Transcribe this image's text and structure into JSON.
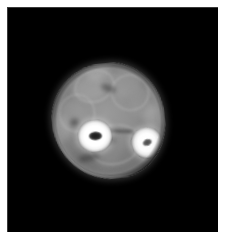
{
  "page": {
    "background_color": "#ffffff",
    "width": 225,
    "height": 239
  },
  "scan": {
    "name": "axial-limb-cross-section",
    "modality": "grayscale-tomographic-slice",
    "background_color": "#000000",
    "canvas": {
      "x": 7,
      "y": 7,
      "width": 211,
      "height": 225
    },
    "visible_text": "",
    "annotations": [],
    "colors": {
      "background": "#000000",
      "soft_tissue_mid": "#8e8e8e",
      "soft_tissue_bright": "#b0b0b0",
      "soft_tissue_dark": "#5a5a5a",
      "cortical_bone": "#ffffff",
      "marrow_dark": "#1a1a1a",
      "marrow_mid": "#5c5c5c",
      "page_margin": "#ffffff"
    },
    "structures": {
      "limb_outline": {
        "label": "limb-cross-section",
        "center_x": 108,
        "center_y": 121,
        "width": 113,
        "height": 116,
        "rotation_deg": -6
      },
      "bone_large": {
        "label": "bone-tibia",
        "center_x": 83,
        "center_y": 127,
        "width": 35,
        "height": 33,
        "marrow_center_x": 84,
        "marrow_center_y": 128,
        "marrow_width": 14,
        "marrow_height": 9,
        "intensity": "hyperintense-cortex-hypointense-marrow"
      },
      "bone_small": {
        "label": "bone-fibula",
        "center_x": 135,
        "center_y": 140,
        "width": 31,
        "height": 32,
        "marrow_center_x": 136,
        "marrow_center_y": 141,
        "marrow_width": 10,
        "marrow_height": 7,
        "intensity": "hyperintense-cortex-isointense-marrow"
      },
      "interosseous_membrane": {
        "label": "interosseous-membrane",
        "start_x": 100,
        "start_y": 131,
        "end_x": 126,
        "end_y": 135
      }
    },
    "soft_tissue_blobs": [
      {
        "name": "muscle-compartment-anterior",
        "x": 24,
        "y": 10,
        "w": 34,
        "h": 26,
        "tone": "#a8a8a8",
        "alpha": 0.55
      },
      {
        "name": "muscle-compartment-anterolateral",
        "x": 58,
        "y": 8,
        "w": 36,
        "h": 28,
        "tone": "#a2a2a2",
        "alpha": 0.48
      },
      {
        "name": "muscle-compartment-lateral",
        "x": 80,
        "y": 28,
        "w": 30,
        "h": 32,
        "tone": "#9c9c9c",
        "alpha": 0.45
      },
      {
        "name": "muscle-compartment-medial",
        "x": 6,
        "y": 34,
        "w": 30,
        "h": 34,
        "tone": "#9e9e9e",
        "alpha": 0.45
      },
      {
        "name": "muscle-compartment-posterior",
        "x": 30,
        "y": 70,
        "w": 48,
        "h": 34,
        "tone": "#8a8a8a",
        "alpha": 0.55
      },
      {
        "name": "muscle-belly-deep-posterior",
        "x": 14,
        "y": 82,
        "w": 30,
        "h": 26,
        "tone": "#6f6f6f",
        "alpha": 0.55
      },
      {
        "name": "muscle-belly-superficial",
        "x": 62,
        "y": 86,
        "w": 34,
        "h": 26,
        "tone": "#777777",
        "alpha": 0.5
      },
      {
        "name": "subcutaneous-fat-anterior",
        "x": 38,
        "y": 2,
        "w": 26,
        "h": 14,
        "tone": "#bdbdbd",
        "alpha": 0.5
      },
      {
        "name": "subcutaneous-fat-lateral",
        "x": 92,
        "y": 46,
        "w": 18,
        "h": 26,
        "tone": "#b5b5b5",
        "alpha": 0.45
      },
      {
        "name": "subcutaneous-fat-medial",
        "x": 2,
        "y": 48,
        "w": 16,
        "h": 26,
        "tone": "#b2b2b2",
        "alpha": 0.42
      }
    ],
    "fascial_lines": [
      {
        "name": "fascial-plane-anterior",
        "x": 26,
        "y": 6,
        "w": 38,
        "h": 30,
        "rot": -14
      },
      {
        "name": "fascial-plane-lateral",
        "x": 62,
        "y": 14,
        "w": 36,
        "h": 34,
        "rot": 18
      },
      {
        "name": "fascial-plane-medial",
        "x": 8,
        "y": 28,
        "w": 34,
        "h": 36,
        "rot": 8
      },
      {
        "name": "fascial-plane-posterior",
        "x": 34,
        "y": 62,
        "w": 50,
        "h": 38,
        "rot": -6
      }
    ],
    "dark_septa": [
      {
        "name": "neurovascular-bundle-posterior",
        "x": 48,
        "y": 72,
        "w": 14,
        "h": 9,
        "rot": 14
      },
      {
        "name": "septum-deep-posterior",
        "x": 22,
        "y": 88,
        "w": 22,
        "h": 8,
        "rot": -10
      },
      {
        "name": "septum-anterior",
        "x": 52,
        "y": 22,
        "w": 16,
        "h": 7,
        "rot": 26
      },
      {
        "name": "vessel-medial",
        "x": 18,
        "y": 52,
        "w": 9,
        "h": 8,
        "rot": 0
      }
    ]
  }
}
